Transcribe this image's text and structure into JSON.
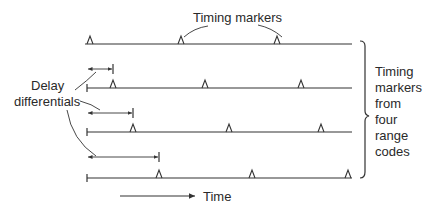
{
  "diagram": {
    "title_top": "Timing markers",
    "left_label_line1": "Delay",
    "left_label_line2": "differentials",
    "right_label": [
      "Timing",
      "markers",
      "from",
      "four",
      "range",
      "codes"
    ],
    "axis_label": "Time",
    "lines": [
      {
        "y": 44,
        "x_start": 85,
        "x_end": 352,
        "start_tick": false,
        "markers": [
          90,
          181,
          277
        ]
      },
      {
        "y": 88,
        "x_start": 87,
        "x_end": 352,
        "start_tick": true,
        "markers": [
          113,
          205,
          301
        ]
      },
      {
        "y": 132,
        "x_start": 87,
        "x_end": 352,
        "start_tick": true,
        "markers": [
          133,
          229,
          321
        ]
      },
      {
        "y": 178,
        "x_start": 87,
        "x_end": 352,
        "start_tick": true,
        "markers": [
          159,
          252,
          348
        ]
      }
    ],
    "delay_arrows": [
      {
        "y": 69,
        "x_start": 87,
        "x_end": 113
      },
      {
        "y": 113,
        "x_start": 87,
        "x_end": 133
      },
      {
        "y": 157,
        "x_start": 87,
        "x_end": 159
      }
    ],
    "line_color": "#333333",
    "text_color": "#2a2a2a"
  }
}
